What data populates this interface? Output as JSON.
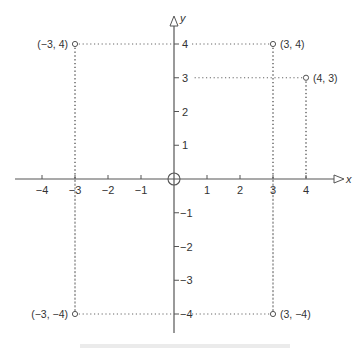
{
  "chart_data": {
    "type": "scatter",
    "title": "",
    "xlabel": "x",
    "ylabel": "y",
    "xlim": [
      -4,
      4
    ],
    "ylim": [
      -4,
      4
    ],
    "grid": false,
    "legend": null,
    "x_ticks": [
      -4,
      -3,
      -2,
      -1,
      1,
      2,
      3,
      4
    ],
    "x_tick_labels": [
      "−4",
      "−3",
      "−2",
      "−1",
      "1",
      "2",
      "3",
      "4"
    ],
    "y_ticks": [
      4,
      3,
      2,
      1,
      -1,
      -2,
      -3,
      -4
    ],
    "y_tick_labels": [
      "4",
      "3",
      "2",
      "1",
      "−1",
      "−2",
      "−3",
      "−4"
    ],
    "points": [
      {
        "x": -3,
        "y": 4,
        "label": "(−3, 4)"
      },
      {
        "x": 3,
        "y": 4,
        "label": "(3, 4)"
      },
      {
        "x": 4,
        "y": 3,
        "label": "(4, 3)"
      },
      {
        "x": -3,
        "y": -4,
        "label": "(−3, −4)"
      },
      {
        "x": 3,
        "y": -4,
        "label": "(3, −4)"
      }
    ],
    "origin_marker": "circle",
    "annotations": [
      "Dotted projection lines from each point to both axes"
    ],
    "caption_partial": "Figure (cut off at bottom edge)"
  },
  "style": {
    "axis_color": "#555555",
    "dot_line_color": "#666666",
    "marker_color": "#555555",
    "text_color": "#333333"
  }
}
